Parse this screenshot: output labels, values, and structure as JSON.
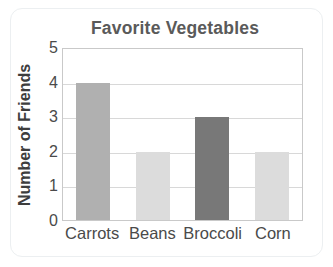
{
  "chart_data": {
    "type": "bar",
    "title": "Favorite Vegetables",
    "xlabel": "",
    "ylabel": "Number of Friends",
    "categories": [
      "Carrots",
      "Beans",
      "Broccoli",
      "Corn"
    ],
    "values": [
      4,
      2,
      3,
      2
    ],
    "ylim": [
      0,
      5
    ],
    "yticks": [
      5,
      4,
      3,
      2,
      1,
      0
    ],
    "ytick_labels": [
      "5",
      "4",
      "3",
      "2",
      "1",
      "0"
    ],
    "grid": true,
    "legend": "none",
    "bar_colors": [
      "#b0b0b0",
      "#dcdcdc",
      "#787878",
      "#dcdcdc"
    ],
    "colors": {
      "title_text": "#5a5a5a",
      "axis_text": "#4a4a4a",
      "ylabel_text": "#3d3d3d",
      "gridline": "#d8d8d8",
      "plot_border": "#c9c9c9",
      "frame_border": "#eceff1",
      "background": "#ffffff"
    }
  }
}
